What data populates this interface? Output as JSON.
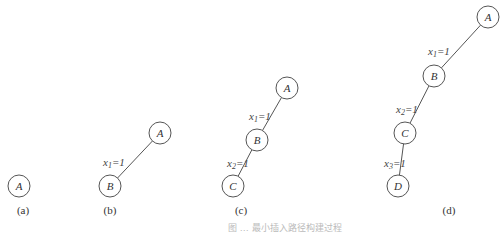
{
  "figure": {
    "caption": "图 … 最小插入路径构建过程",
    "panels": [
      {
        "label": "(a)",
        "nodes": [
          "A"
        ],
        "edges": []
      },
      {
        "label": "(b)",
        "nodes": [
          "A",
          "B"
        ],
        "edges": [
          {
            "from": "A",
            "to": "B",
            "var": "x",
            "sub": "1",
            "val": "=1"
          }
        ]
      },
      {
        "label": "(c)",
        "nodes": [
          "A",
          "B",
          "C"
        ],
        "edges": [
          {
            "from": "A",
            "to": "B",
            "var": "x",
            "sub": "1",
            "val": "=1"
          },
          {
            "from": "B",
            "to": "C",
            "var": "x",
            "sub": "2",
            "val": "=1"
          }
        ]
      },
      {
        "label": "(d)",
        "nodes": [
          "A",
          "B",
          "C",
          "D"
        ],
        "edges": [
          {
            "from": "A",
            "to": "B",
            "var": "x",
            "sub": "1",
            "val": "=1"
          },
          {
            "from": "B",
            "to": "C",
            "var": "x",
            "sub": "2",
            "val": "=1"
          },
          {
            "from": "C",
            "to": "D",
            "var": "x",
            "sub": "3",
            "val": "=1"
          }
        ]
      }
    ]
  }
}
